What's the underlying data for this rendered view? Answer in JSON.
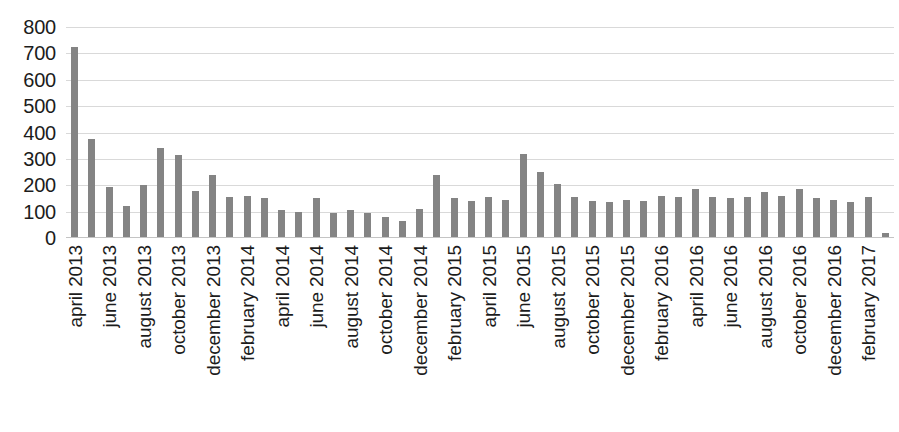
{
  "chart_data": {
    "type": "bar",
    "title": "",
    "subtitle": "",
    "xlabel": "",
    "ylabel": "",
    "ylim": [
      0,
      800
    ],
    "yticks": [
      800,
      700,
      600,
      500,
      400,
      300,
      200,
      100,
      0
    ],
    "grid": true,
    "legend": false,
    "bar_color": "#848484",
    "categories": [
      "april 2013",
      "may 2013",
      "june 2013",
      "july 2013",
      "august 2013",
      "september 2013",
      "october 2013",
      "november 2013",
      "december 2013",
      "january 2014",
      "february 2014",
      "march 2014",
      "april 2014",
      "may 2014",
      "june 2014",
      "july 2014",
      "august 2014",
      "september 2014",
      "october 2014",
      "november 2014",
      "december 2014",
      "january 2015",
      "february 2015",
      "march 2015",
      "april 2015",
      "may 2015",
      "june 2015",
      "july 2015",
      "august 2015",
      "september 2015",
      "october 2015",
      "november 2015",
      "december 2015",
      "january 2016",
      "february 2016",
      "march 2016",
      "april 2016",
      "may 2016",
      "june 2016",
      "july 2016",
      "august 2016",
      "september 2016",
      "october 2016",
      "november 2016",
      "december 2016",
      "january 2017",
      "february 2017",
      "march 2017"
    ],
    "values": [
      725,
      375,
      195,
      120,
      200,
      340,
      315,
      180,
      240,
      155,
      160,
      150,
      105,
      100,
      150,
      95,
      105,
      95,
      80,
      65,
      110,
      240,
      150,
      140,
      155,
      145,
      320,
      250,
      205,
      155,
      140,
      135,
      145,
      140,
      160,
      155,
      185,
      155,
      150,
      155,
      175,
      160,
      185,
      150,
      145,
      135,
      155,
      20
    ],
    "tick_labels_x": [
      "april 2013",
      "june 2013",
      "august 2013",
      "october 2013",
      "december 2013",
      "february 2014",
      "april 2014",
      "june 2014",
      "august 2014",
      "october 2014",
      "december 2014",
      "february 2015",
      "april 2015",
      "june 2015",
      "august 2015",
      "october 2015",
      "december 2015",
      "february 2016",
      "april 2016",
      "june 2016",
      "august 2016",
      "october 2016",
      "december 2016",
      "february 2017"
    ],
    "tick_label_interval": 2
  }
}
